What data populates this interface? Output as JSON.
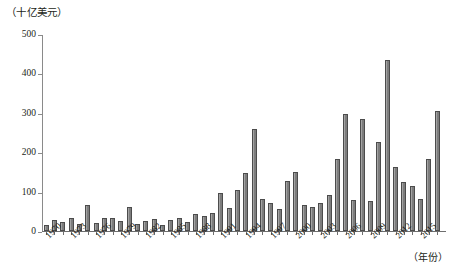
{
  "chart_data": {
    "type": "bar",
    "title": "",
    "unit_caption": "（十亿美元）",
    "xlabel": "（年份）",
    "ylabel": "",
    "ylim": [
      0,
      500
    ],
    "yticks": [
      0,
      100,
      200,
      300,
      400,
      500
    ],
    "grid": false,
    "legend": null,
    "xlabel_step": 3,
    "categories": [
      "1970",
      "1971",
      "1972",
      "1973",
      "1974",
      "1975",
      "1976",
      "1977",
      "1978",
      "1979",
      "1980",
      "1981",
      "1982",
      "1983",
      "1984",
      "1985",
      "1986",
      "1987",
      "1988",
      "1989",
      "1990",
      "1991",
      "1992",
      "1993",
      "1994",
      "1995",
      "1996",
      "1997",
      "1998",
      "1999",
      "2000",
      "2001",
      "2002",
      "2003",
      "2004",
      "2005",
      "2006",
      "2007",
      "2008",
      "2009",
      "2010",
      "2011",
      "2012",
      "2013",
      "2014",
      "2015",
      "2016",
      "2017"
    ],
    "values": [
      14,
      27,
      22,
      33,
      18,
      66,
      20,
      32,
      33,
      26,
      62,
      19,
      26,
      30,
      15,
      28,
      34,
      23,
      43,
      37,
      45,
      96,
      59,
      103,
      148,
      260,
      80,
      72,
      55,
      128,
      150,
      65,
      60,
      72,
      92,
      184,
      296,
      79,
      285,
      75,
      226,
      435,
      163,
      124,
      113,
      80,
      182,
      305
    ],
    "tick_labels": [
      "1970",
      "1973",
      "1976",
      "1979",
      "1982",
      "1985",
      "1988",
      "1991",
      "1994",
      "1997",
      "2000",
      "2003",
      "2006",
      "2009",
      "2012",
      "2015"
    ]
  },
  "style": {
    "bar_fill": "#7d7d7d",
    "bar_stroke": "#4c4c4c",
    "axis_color": "#6e6e6e",
    "text_color": "#231f20"
  }
}
